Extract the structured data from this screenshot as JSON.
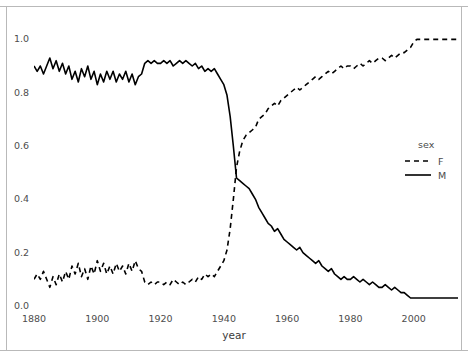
{
  "chart_data": {
    "type": "line",
    "title": "",
    "subtitle": "",
    "xlabel": "year",
    "ylabel": "",
    "xlim": [
      1880,
      2014
    ],
    "ylim": [
      0.0,
      1.05
    ],
    "grid": false,
    "legend_position": "right",
    "legend_title": "sex",
    "x_ticks": [
      "1880",
      "1900",
      "1920",
      "1940",
      "1960",
      "1980",
      "2000"
    ],
    "x_tick_values": [
      1880,
      1900,
      1920,
      1940,
      1960,
      1980,
      2000
    ],
    "y_ticks": [
      "0.0",
      "0.2",
      "0.4",
      "0.6",
      "0.8",
      "1.0"
    ],
    "y_tick_values": [
      0.0,
      0.2,
      0.4,
      0.6,
      0.8,
      1.0
    ],
    "x": [
      1880,
      1881,
      1882,
      1883,
      1884,
      1885,
      1886,
      1887,
      1888,
      1889,
      1890,
      1891,
      1892,
      1893,
      1894,
      1895,
      1896,
      1897,
      1898,
      1899,
      1900,
      1901,
      1902,
      1903,
      1904,
      1905,
      1906,
      1907,
      1908,
      1909,
      1910,
      1911,
      1912,
      1913,
      1914,
      1915,
      1916,
      1917,
      1918,
      1919,
      1920,
      1921,
      1922,
      1923,
      1924,
      1925,
      1926,
      1927,
      1928,
      1929,
      1930,
      1931,
      1932,
      1933,
      1934,
      1935,
      1936,
      1937,
      1938,
      1939,
      1940,
      1941,
      1942,
      1943,
      1944,
      1945,
      1946,
      1947,
      1948,
      1949,
      1950,
      1951,
      1952,
      1953,
      1954,
      1955,
      1956,
      1957,
      1958,
      1959,
      1960,
      1961,
      1962,
      1963,
      1964,
      1965,
      1966,
      1967,
      1968,
      1969,
      1970,
      1971,
      1972,
      1973,
      1974,
      1975,
      1976,
      1977,
      1978,
      1979,
      1980,
      1981,
      1982,
      1983,
      1984,
      1985,
      1986,
      1987,
      1988,
      1989,
      1990,
      1991,
      1992,
      1993,
      1994,
      1995,
      1996,
      1997,
      1998,
      1999,
      2000,
      2001,
      2002,
      2003,
      2004,
      2005,
      2006,
      2007,
      2008,
      2009,
      2010,
      2011,
      2012,
      2013,
      2014
    ],
    "series": [
      {
        "name": "F",
        "linetype": "dashed",
        "color": "#000000",
        "values": [
          0.1,
          0.12,
          0.1,
          0.13,
          0.1,
          0.07,
          0.11,
          0.08,
          0.12,
          0.09,
          0.13,
          0.1,
          0.15,
          0.12,
          0.16,
          0.11,
          0.14,
          0.1,
          0.15,
          0.12,
          0.17,
          0.13,
          0.16,
          0.12,
          0.15,
          0.12,
          0.16,
          0.13,
          0.15,
          0.12,
          0.16,
          0.13,
          0.17,
          0.14,
          0.13,
          0.09,
          0.08,
          0.09,
          0.08,
          0.09,
          0.09,
          0.08,
          0.09,
          0.08,
          0.1,
          0.09,
          0.08,
          0.09,
          0.08,
          0.09,
          0.1,
          0.09,
          0.11,
          0.1,
          0.12,
          0.11,
          0.12,
          0.11,
          0.13,
          0.15,
          0.17,
          0.21,
          0.29,
          0.4,
          0.52,
          0.58,
          0.62,
          0.64,
          0.65,
          0.66,
          0.67,
          0.7,
          0.71,
          0.72,
          0.74,
          0.75,
          0.76,
          0.75,
          0.77,
          0.78,
          0.79,
          0.8,
          0.81,
          0.82,
          0.81,
          0.82,
          0.83,
          0.84,
          0.85,
          0.86,
          0.85,
          0.86,
          0.87,
          0.88,
          0.87,
          0.88,
          0.89,
          0.9,
          0.89,
          0.9,
          0.9,
          0.89,
          0.9,
          0.91,
          0.9,
          0.91,
          0.92,
          0.91,
          0.92,
          0.93,
          0.93,
          0.92,
          0.93,
          0.94,
          0.93,
          0.94,
          0.95,
          0.95,
          0.96,
          0.97,
          0.99,
          1.0,
          1.0,
          1.0,
          1.0,
          1.0,
          1.0,
          1.0,
          1.0,
          1.0,
          1.0,
          1.0,
          1.0,
          1.0,
          1.0
        ]
      },
      {
        "name": "M",
        "linetype": "solid",
        "color": "#000000",
        "values": [
          0.9,
          0.88,
          0.9,
          0.87,
          0.9,
          0.93,
          0.89,
          0.92,
          0.88,
          0.91,
          0.87,
          0.9,
          0.85,
          0.88,
          0.84,
          0.89,
          0.86,
          0.9,
          0.85,
          0.88,
          0.83,
          0.87,
          0.84,
          0.88,
          0.85,
          0.88,
          0.84,
          0.87,
          0.85,
          0.88,
          0.84,
          0.87,
          0.83,
          0.86,
          0.87,
          0.91,
          0.92,
          0.91,
          0.92,
          0.91,
          0.91,
          0.92,
          0.91,
          0.92,
          0.9,
          0.91,
          0.92,
          0.91,
          0.92,
          0.91,
          0.9,
          0.91,
          0.89,
          0.9,
          0.88,
          0.89,
          0.88,
          0.89,
          0.87,
          0.85,
          0.83,
          0.79,
          0.71,
          0.6,
          0.48,
          0.47,
          0.46,
          0.45,
          0.44,
          0.42,
          0.4,
          0.37,
          0.35,
          0.33,
          0.31,
          0.3,
          0.28,
          0.29,
          0.27,
          0.25,
          0.24,
          0.23,
          0.22,
          0.21,
          0.22,
          0.2,
          0.19,
          0.18,
          0.17,
          0.16,
          0.17,
          0.15,
          0.14,
          0.13,
          0.14,
          0.12,
          0.11,
          0.1,
          0.11,
          0.1,
          0.1,
          0.11,
          0.1,
          0.09,
          0.1,
          0.09,
          0.08,
          0.09,
          0.08,
          0.07,
          0.07,
          0.08,
          0.07,
          0.06,
          0.07,
          0.06,
          0.05,
          0.05,
          0.04,
          0.03,
          0.03,
          0.03,
          0.03,
          0.03,
          0.03,
          0.03,
          0.03,
          0.03,
          0.03,
          0.03,
          0.03,
          0.03,
          0.03,
          0.03,
          0.03
        ]
      }
    ]
  },
  "axes": {
    "x_title": "year"
  },
  "legend": {
    "title": "sex",
    "entries": [
      {
        "label": "F",
        "key": "dashed-line-key"
      },
      {
        "label": "M",
        "key": "solid-line-key"
      }
    ]
  }
}
